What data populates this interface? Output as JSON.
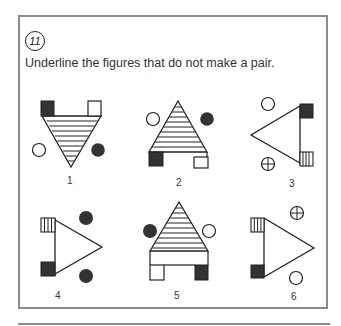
{
  "exercise": {
    "number": "11",
    "instruction": "Underline the figures that do not make a pair."
  },
  "figures": [
    {
      "label": "1",
      "shape": "triangle-down",
      "stripes": "horizontal",
      "top_left_square": "black",
      "top_right_square": "white",
      "left_circle": "white",
      "right_circle": "black"
    },
    {
      "label": "2",
      "shape": "triangle-up",
      "stripes": "horizontal",
      "bottom_left_square": "black",
      "bottom_right_square": "white",
      "left_circle": "white",
      "right_circle": "black"
    },
    {
      "label": "3",
      "shape": "triangle-left",
      "stripes": "none",
      "top_square": "black",
      "bottom_square": "vertical-stripes",
      "top_circle": "white",
      "bottom_circle": "crosshair"
    },
    {
      "label": "4",
      "shape": "triangle-right",
      "stripes": "none",
      "top_square": "vertical-stripes",
      "bottom_square": "black",
      "top_circle": "black",
      "bottom_circle": "black"
    },
    {
      "label": "5",
      "shape": "triangle-up",
      "stripes": "horizontal",
      "bottom_left_square": "white",
      "bottom_right_square": "black",
      "left_circle": "black",
      "right_circle": "white"
    },
    {
      "label": "6",
      "shape": "triangle-right",
      "stripes": "none",
      "top_square": "vertical-stripes",
      "bottom_square": "black",
      "top_circle": "crosshair",
      "bottom_circle": "white"
    }
  ],
  "colors": {
    "ink": "#222222",
    "dark_fill": "#333333",
    "frame": "#8a8a8a"
  }
}
